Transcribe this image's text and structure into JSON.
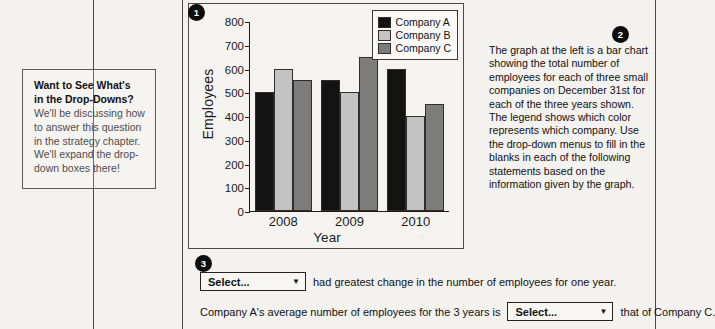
{
  "callout": {
    "title_line1": "Want to See What's",
    "title_line2": "in the Drop-Downs?",
    "body": "We'll be discussing how to answer this question in the strategy chapter. We'll expand the drop-down boxes there!"
  },
  "badges": {
    "one": "1",
    "two": "2",
    "three": "3"
  },
  "description": {
    "text": "The graph at the left is a bar chart showing the total number of employees for each of three small companies on December 31st for each of the three years shown. The legend shows which color represents which company. Use the drop-down menus to fill in the blanks in each of the following statements based on the information given by the graph."
  },
  "questions": {
    "q1_dropdown": "Select...",
    "q1_text": "had greatest change in the number of employees for one year.",
    "q2_prefix": "Company A's average number of employees for the 3 years is",
    "q2_dropdown": "Select...",
    "q2_suffix": "that of Company C.",
    "caret": "▼"
  },
  "colors": {
    "company_a": "#131313",
    "company_b": "#c3c3c3",
    "company_c": "#7c7c7c",
    "axis": "#1a1a1a",
    "rule": "#4a4a4a"
  },
  "chart_data": {
    "type": "bar",
    "title": "",
    "xlabel": "Year",
    "ylabel": "Employees",
    "categories": [
      "2008",
      "2009",
      "2010"
    ],
    "series": [
      {
        "name": "Company A",
        "values": [
          500,
          550,
          600
        ],
        "color": "#131313"
      },
      {
        "name": "Company B",
        "values": [
          600,
          500,
          400
        ],
        "color": "#c3c3c3"
      },
      {
        "name": "Company C",
        "values": [
          550,
          650,
          450
        ],
        "color": "#7c7c7c"
      }
    ],
    "ylim": [
      0,
      800
    ],
    "yticks": [
      800,
      700,
      600,
      500,
      400,
      300,
      200,
      100,
      0
    ],
    "grid": false,
    "legend_position": "top-right"
  }
}
